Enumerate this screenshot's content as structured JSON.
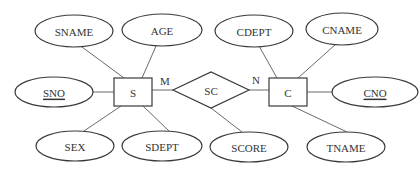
{
  "diagram": {
    "type": "er-diagram",
    "entities": [
      {
        "id": "S",
        "label": "S",
        "x": 114,
        "y": 78,
        "w": 38,
        "h": 28
      },
      {
        "id": "C",
        "label": "C",
        "x": 269,
        "y": 78,
        "w": 38,
        "h": 28
      }
    ],
    "relationship": {
      "id": "SC",
      "label": "SC",
      "cx": 211,
      "cy": 90,
      "hw": 38,
      "hh": 18
    },
    "cardinalities": [
      {
        "label": "M",
        "x": 165,
        "y": 81
      },
      {
        "label": "N",
        "x": 256,
        "y": 80
      }
    ],
    "attributes": [
      {
        "id": "SNAME",
        "label": "SNAME",
        "cx": 74,
        "cy": 31,
        "rx": 39,
        "ry": 16,
        "key": false,
        "owner": "S"
      },
      {
        "id": "AGE",
        "label": "AGE",
        "cx": 162,
        "cy": 30,
        "rx": 40,
        "ry": 16,
        "key": false,
        "owner": "S"
      },
      {
        "id": "SNO",
        "label": "SNO",
        "cx": 54,
        "cy": 92,
        "rx": 39,
        "ry": 15,
        "key": true,
        "owner": "S"
      },
      {
        "id": "SEX",
        "label": "SEX",
        "cx": 75,
        "cy": 146,
        "rx": 39,
        "ry": 15,
        "key": false,
        "owner": "S"
      },
      {
        "id": "SDEPT",
        "label": "SDEPT",
        "cx": 162,
        "cy": 146,
        "rx": 40,
        "ry": 15,
        "key": false,
        "owner": "S"
      },
      {
        "id": "CDEPT",
        "label": "CDEPT",
        "cx": 254,
        "cy": 31,
        "rx": 39,
        "ry": 16,
        "key": false,
        "owner": "C"
      },
      {
        "id": "CNAME",
        "label": "CNAME",
        "cx": 342,
        "cy": 29,
        "rx": 36,
        "ry": 16,
        "key": false,
        "owner": "C"
      },
      {
        "id": "CNO",
        "label": "CNO",
        "cx": 375,
        "cy": 92,
        "rx": 43,
        "ry": 15,
        "key": true,
        "owner": "C"
      },
      {
        "id": "SCORE",
        "label": "SCORE",
        "cx": 249,
        "cy": 147,
        "rx": 39,
        "ry": 15,
        "key": false,
        "owner": "SC"
      },
      {
        "id": "TNAME",
        "label": "TNAME",
        "cx": 346,
        "cy": 147,
        "rx": 39,
        "ry": 15,
        "key": false,
        "owner": "C"
      }
    ],
    "edges": [
      {
        "from": "SNAME",
        "x1": 82,
        "y1": 47,
        "x2": 124,
        "y2": 78
      },
      {
        "from": "AGE",
        "x1": 156,
        "y1": 46,
        "x2": 142,
        "y2": 78
      },
      {
        "from": "SNO",
        "x1": 93,
        "y1": 92,
        "x2": 114,
        "y2": 92
      },
      {
        "from": "SEX",
        "x1": 84,
        "y1": 131,
        "x2": 121,
        "y2": 106
      },
      {
        "from": "SDEPT",
        "x1": 169,
        "y1": 131,
        "x2": 143,
        "y2": 106
      },
      {
        "from": "S-SC",
        "x1": 152,
        "y1": 90,
        "x2": 173,
        "y2": 90
      },
      {
        "from": "SC-C",
        "x1": 249,
        "y1": 90,
        "x2": 269,
        "y2": 90
      },
      {
        "from": "S-SC-top",
        "x1": 152,
        "y1": 90,
        "x2": 152,
        "y2": 90
      },
      {
        "from": "SCORE",
        "x1": 242,
        "y1": 132,
        "x2": 211,
        "y2": 108
      },
      {
        "from": "CDEPT",
        "x1": 259,
        "y1": 46,
        "x2": 277,
        "y2": 78
      },
      {
        "from": "CNAME",
        "x1": 336,
        "y1": 44,
        "x2": 298,
        "y2": 78
      },
      {
        "from": "CNO",
        "x1": 307,
        "y1": 92,
        "x2": 332,
        "y2": 92
      },
      {
        "from": "TNAME",
        "x1": 347,
        "y1": 132,
        "x2": 292,
        "y2": 106
      }
    ]
  }
}
